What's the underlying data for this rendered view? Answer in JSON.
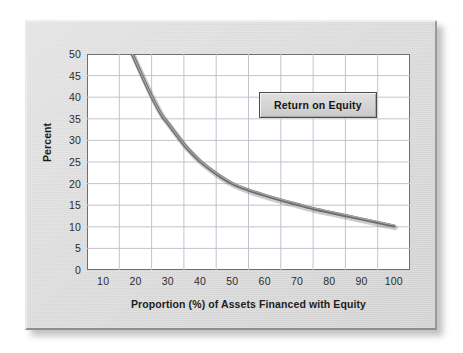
{
  "figure": {
    "panel_background": "#dcdcdc",
    "plot_background": "#ffffff",
    "border_color": "#6f6f6f"
  },
  "legend": {
    "label": "Return on Equity",
    "position": "inside-top-right"
  },
  "chart_data": {
    "type": "line",
    "title": "",
    "subtitle": "",
    "xlabel": "Proportion (%) of Assets Financed with Equity",
    "ylabel": "Percent",
    "xlim": [
      5,
      105
    ],
    "ylim": [
      0,
      50
    ],
    "grid": true,
    "grid_color": "#c3c3cf",
    "legend_position": "inside-top-right",
    "xticks": [
      10,
      20,
      30,
      40,
      50,
      60,
      70,
      80,
      90,
      100
    ],
    "xtick_labels": [
      "10",
      "20",
      "30",
      "40",
      "50",
      "60",
      "70",
      "80",
      "90",
      "100"
    ],
    "yticks": [
      0,
      5,
      10,
      15,
      20,
      25,
      30,
      35,
      40,
      45,
      50
    ],
    "ytick_labels": [
      "0",
      "5",
      "10",
      "15",
      "20",
      "25",
      "30",
      "35",
      "40",
      "45",
      "50"
    ],
    "series": [
      {
        "name": "Return on Equity",
        "color": "#6e6e6e",
        "line_width": 3.2,
        "x": [
          19,
          22,
          25,
          28,
          30,
          33,
          36,
          40,
          45,
          50,
          55,
          60,
          65,
          70,
          75,
          80,
          85,
          90,
          95,
          100
        ],
        "values": [
          50.0,
          45.0,
          40.2,
          36.0,
          34.0,
          31.0,
          28.2,
          25.2,
          22.3,
          20.0,
          18.5,
          17.3,
          16.2,
          15.2,
          14.2,
          13.4,
          12.6,
          11.8,
          11.0,
          10.2
        ]
      }
    ]
  }
}
